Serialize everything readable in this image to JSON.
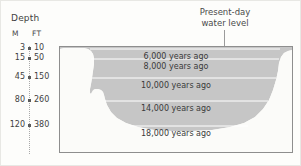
{
  "axis": {
    "title": "Depth",
    "unit_metric": "M",
    "unit_imperial": "FT",
    "rows": [
      {
        "m": "3",
        "ft": "10",
        "y": 47
      },
      {
        "m": "15",
        "ft": "50",
        "y": 57
      },
      {
        "m": "45",
        "ft": "150",
        "y": 76
      },
      {
        "m": "80",
        "ft": "260",
        "y": 99
      },
      {
        "m": "120",
        "ft": "380",
        "y": 124
      }
    ]
  },
  "callout": {
    "line1": "Present-day",
    "line2": "water level"
  },
  "chart_data": {
    "type": "area",
    "xlabel": "",
    "ylabel": "Depth",
    "grid": true,
    "legend_position": "none",
    "depth_units": [
      "M",
      "FT"
    ],
    "ylim_m": [
      0,
      140
    ],
    "ylim_ft": [
      0,
      450
    ],
    "categories": [
      "6,000 years ago",
      "8,000 years ago",
      "10,000 years ago",
      "14,000 years ago",
      "18,000 years ago"
    ],
    "series": [
      {
        "name": "Water level depth below present-day surface",
        "values_m": [
          3,
          15,
          45,
          80,
          120
        ],
        "values_ft": [
          10,
          50,
          150,
          260,
          380
        ]
      }
    ],
    "annotations": [
      {
        "text": "Present-day water level",
        "points_to": "top of basin"
      }
    ],
    "levels": [
      {
        "label": "6,000 years ago",
        "depth_m": 3,
        "depth_ft": 10,
        "y": 2
      },
      {
        "label": "8,000 years ago",
        "depth_m": 15,
        "depth_ft": 50,
        "y": 12
      },
      {
        "label": "10,000 years ago",
        "depth_m": 45,
        "depth_ft": 150,
        "y": 31
      },
      {
        "label": "14,000 years ago",
        "depth_m": 80,
        "depth_ft": 260,
        "y": 54
      },
      {
        "label": "18,000 years ago",
        "depth_m": 120,
        "depth_ft": 380,
        "y": 79
      }
    ],
    "colors": {
      "water": "#c6c6c6",
      "basin": "#fbfbf9",
      "level_line": "#ffffff",
      "text": "#3a3a3a",
      "frame": "#8e8e8e"
    }
  }
}
